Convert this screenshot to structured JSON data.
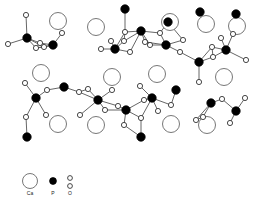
{
  "figure": {
    "background_color": "#ffffff"
  },
  "legend": {
    "items": [
      {
        "symbol": "Ca",
        "label": "Ca",
        "glyph": "large-open-circle",
        "fill": "#ffffff",
        "stroke": "#777777",
        "radius": 7.5
      },
      {
        "symbol": "P",
        "label": "P",
        "glyph": "filled-circle",
        "fill": "#000000",
        "stroke": "#000000",
        "radius": 3.4
      },
      {
        "symbol": "O",
        "label": "O",
        "glyph": "small-open-circle-pair",
        "fill": "#ffffff",
        "stroke": "#333333",
        "radius": 2.4
      }
    ]
  },
  "chart_data": {
    "type": "scatter",
    "xlabel": "",
    "ylabel": "",
    "xlim": [
      0,
      264
    ],
    "ylim": [
      0,
      170
    ],
    "grid": false,
    "legend_position": "bottom-left",
    "series": [
      {
        "name": "Ca",
        "marker": "open-circle-large",
        "radius": 8.5,
        "fill": "#ffffff",
        "stroke": "#888888",
        "points": [
          [
            58,
            21
          ],
          [
            96,
            27
          ],
          [
            170,
            22
          ],
          [
            206,
            24
          ],
          [
            237,
            26
          ],
          [
            41,
            73
          ],
          [
            112,
            77
          ],
          [
            157,
            74
          ],
          [
            224,
            77
          ],
          [
            58,
            124
          ],
          [
            96,
            125
          ],
          [
            171,
            124
          ],
          [
            207,
            125
          ]
        ]
      },
      {
        "name": "P",
        "marker": "filled-circle",
        "radius": 4.2,
        "fill": "#000000",
        "stroke": "#000000",
        "points": [
          [
            27,
            38
          ],
          [
            53,
            45
          ],
          [
            125,
            9
          ],
          [
            115,
            49
          ],
          [
            141,
            31
          ],
          [
            166,
            45
          ],
          [
            168,
            22
          ],
          [
            199,
            62
          ],
          [
            226,
            50
          ],
          [
            236,
            14
          ],
          [
            200,
            12
          ],
          [
            64,
            87
          ],
          [
            36,
            98
          ],
          [
            98,
            100
          ],
          [
            126,
            110
          ],
          [
            152,
            98
          ],
          [
            176,
            90
          ],
          [
            211,
            103
          ],
          [
            236,
            111
          ],
          [
            27,
            137
          ],
          [
            141,
            137
          ]
        ]
      },
      {
        "name": "O",
        "marker": "open-circle-small",
        "radius": 2.6,
        "fill": "#ffffff",
        "stroke": "#333333",
        "points": [
          [
            26,
            15
          ],
          [
            8,
            44
          ],
          [
            36,
            48
          ],
          [
            44,
            47
          ],
          [
            40,
            43
          ],
          [
            62,
            33
          ],
          [
            101,
            49
          ],
          [
            125,
            32
          ],
          [
            124,
            41
          ],
          [
            111,
            41
          ],
          [
            145,
            42
          ],
          [
            150,
            45
          ],
          [
            130,
            52
          ],
          [
            160,
            33
          ],
          [
            183,
            40
          ],
          [
            180,
            52
          ],
          [
            212,
            47
          ],
          [
            221,
            38
          ],
          [
            213,
            57
          ],
          [
            233,
            34
          ],
          [
            246,
            60
          ],
          [
            25,
            83
          ],
          [
            47,
            90
          ],
          [
            79,
            92
          ],
          [
            46,
            115
          ],
          [
            80,
            115
          ],
          [
            88,
            89
          ],
          [
            112,
            90
          ],
          [
            140,
            86
          ],
          [
            144,
            100
          ],
          [
            158,
            111
          ],
          [
            105,
            110
          ],
          [
            118,
            106
          ],
          [
            171,
            105
          ],
          [
            199,
            82
          ],
          [
            222,
            99
          ],
          [
            203,
            117
          ],
          [
            245,
            98
          ],
          [
            230,
            123
          ],
          [
            26,
            117
          ],
          [
            124,
            125
          ],
          [
            141,
            118
          ],
          [
            196,
            120
          ]
        ]
      }
    ]
  },
  "structure": {
    "description": "Projected apatite lattice: PO4 tetrahedra linked through bridging O, with Ca columns shown as large open circles",
    "bond_color": "#555555",
    "bond_width": 0.9
  }
}
